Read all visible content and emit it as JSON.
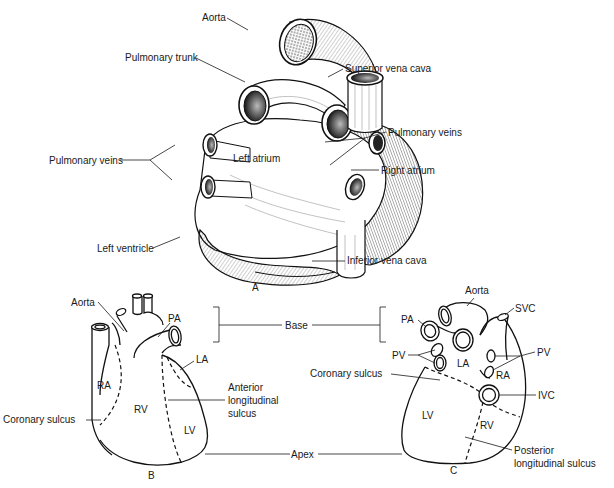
{
  "figure_A": {
    "caption": "A",
    "labels": {
      "aorta": "Aorta",
      "pulmonary_trunk": "Pulmonary trunk",
      "superior_vena_cava": "Superior vena cava",
      "pulmonary_veins_left": "Pulmonary veins",
      "pulmonary_veins_right": "Pulmonary veins",
      "left_atrium": "Left atrium",
      "right_atrium": "Right atrium",
      "left_ventricle": "Left ventricle",
      "inferior_vena_cava": "Inferior vena cava"
    }
  },
  "figure_B": {
    "caption": "B",
    "labels": {
      "aorta": "Aorta",
      "pa": "PA",
      "la": "LA",
      "ra": "RA",
      "rv": "RV",
      "lv": "LV",
      "coronary_sulcus": "Coronary sulcus",
      "anterior_line1": "Anterior",
      "anterior_line2": "longitudinal",
      "anterior_line3": "sulcus"
    }
  },
  "figure_C": {
    "caption": "C",
    "labels": {
      "aorta": "Aorta",
      "svc": "SVC",
      "pa": "PA",
      "pv_left": "PV",
      "pv_right": "PV",
      "la": "LA",
      "ra": "RA",
      "ivc": "IVC",
      "lv": "LV",
      "rv": "RV",
      "coronary_sulcus": "Coronary sulcus",
      "posterior_line1": "Posterior",
      "posterior_line2": "longitudinal sulcus"
    }
  },
  "shared": {
    "base": "Base",
    "apex": "Apex"
  }
}
